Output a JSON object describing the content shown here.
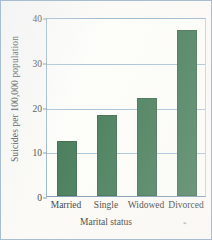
{
  "chart_data": {
    "type": "bar",
    "title": "",
    "categories": [
      "Married",
      "Single",
      "Widowed",
      "Divorced"
    ],
    "values": [
      12.4,
      18.2,
      22.0,
      37.0
    ],
    "xlabel": "Marital status",
    "ylabel": "Suicides per 100,000 population",
    "ylim": [
      0,
      40
    ],
    "yticks": [
      0,
      10,
      20,
      30,
      40
    ],
    "ytick_labels": [
      "0",
      "10",
      "20",
      "30",
      "40"
    ],
    "grid": true,
    "legend": null,
    "bar_color": "#2d6b44",
    "gridline_color": "#9dbcd4",
    "axis_color": "#6d8ea8",
    "background_color": "#fdfdfa"
  },
  "annotations": {
    "stray_mark": "*"
  }
}
